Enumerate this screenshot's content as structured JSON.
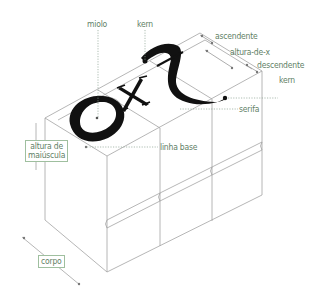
{
  "diagram": {
    "glyphs": [
      "o",
      "x",
      "f"
    ],
    "colors": {
      "label_text": "#5f7f66",
      "outline": "#9a9a9a",
      "glyph": "#111111",
      "leader": "#8aa090",
      "box_border": "#9fbf9f"
    },
    "labels": {
      "miolo": "miolo",
      "kern_top": "kern",
      "ascendente": "ascendente",
      "altura_de_x": "altura-de-x",
      "descendente": "descendente",
      "kern_right": "kern",
      "serifa": "serifa",
      "altura_maiuscula_1": "altura de",
      "altura_maiuscula_2": "maiúscula",
      "linha_base": "linha base",
      "corpo": "corpo"
    }
  }
}
